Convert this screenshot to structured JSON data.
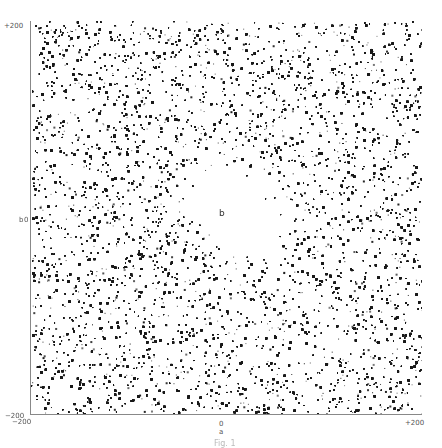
{
  "figure": {
    "caption": "Fig. 1"
  },
  "axes": {
    "x_label": "a",
    "y_label": "b",
    "x_ticks": {
      "left": "−200",
      "mid": "0",
      "right": "+200"
    },
    "y_ticks": {
      "top": "+200",
      "mid": "0",
      "bottom": "−200"
    }
  },
  "center_marker": "b",
  "colors": {
    "background": "#ffffff",
    "point": "#1a1a1a",
    "axis": "#888888"
  },
  "chart_data": {
    "type": "scatter",
    "title": "",
    "xlabel": "a",
    "ylabel": "b",
    "xlim": [
      -200,
      200
    ],
    "ylim": [
      -200,
      200
    ],
    "x_tick_labels": [
      "-200",
      "0",
      "+200"
    ],
    "y_tick_labels": [
      "-200",
      "0",
      "+200"
    ],
    "grid": false,
    "legend": null,
    "point_count_estimate": 60000,
    "void": {
      "center": [
        8,
        8
      ],
      "semi_major": 36,
      "semi_minor": 22,
      "rotation_deg": 35,
      "halo_extent_factor": 2.2
    },
    "annotations": [
      {
        "text": "b",
        "x": 0,
        "y": 5
      }
    ]
  }
}
